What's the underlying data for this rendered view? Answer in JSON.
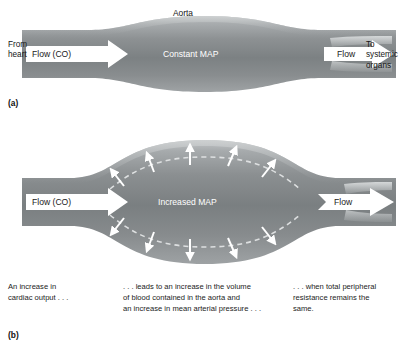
{
  "figure": {
    "panel_a": {
      "tag": "(a)",
      "aorta_label": "Aorta",
      "from_label": "From\nheart",
      "to_label": "To\nsystemic\norgans",
      "inflow_label": "Flow (CO)",
      "outflow_label": "Flow",
      "vessel_label": "Constant MAP"
    },
    "panel_b": {
      "tag": "(b)",
      "inflow_label": "Flow (CO)",
      "outflow_label": "Flow",
      "vessel_label": "Increased MAP",
      "distension_arrows_top": 5,
      "distension_arrows_bottom": 5
    },
    "caption": {
      "left": "An increase in\ncardiac output . . .",
      "middle": ". . . leads to an increase in the volume\nof blood contained in the aorta and\nan increase in mean arterial pressure . . .",
      "right": ". . . when total peripheral\nresistance remains the\nsame."
    },
    "colors": {
      "vessel_light": "#b9bcbd",
      "vessel_mid": "#8e9294",
      "vessel_dark": "#6f7476",
      "vessel_edge": "#9aa0a2",
      "arrow_fill": "#ffffff",
      "text_dark": "#1a1a1a",
      "background": "#ffffff"
    }
  }
}
